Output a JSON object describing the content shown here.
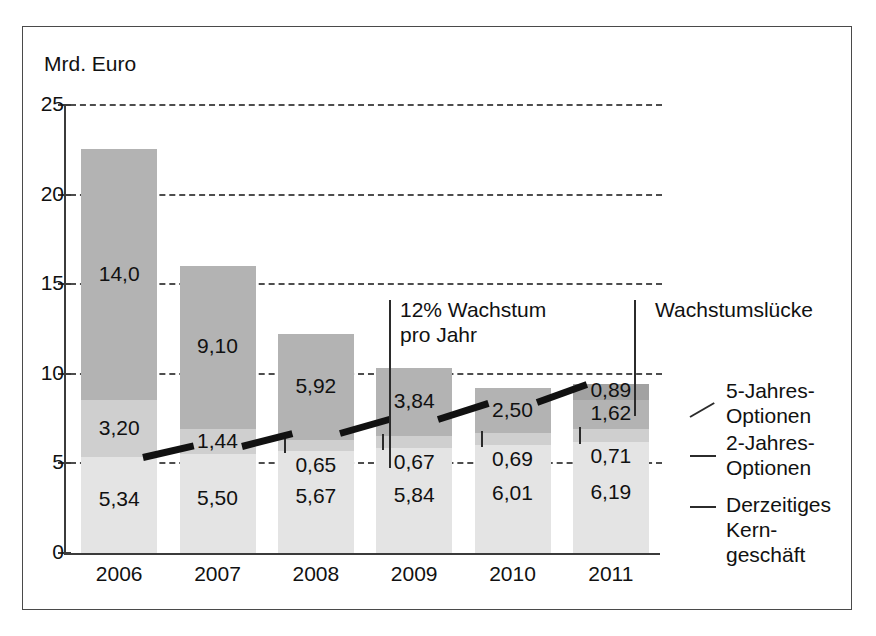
{
  "figure": {
    "y_axis_title": "Mrd. Euro",
    "scan_artifact_text": "· · · · · · · · ·"
  },
  "annotations": {
    "growth_rate": "12% Wachstum\npro Jahr",
    "growth_rate_line1": "12% Wachstum",
    "growth_rate_line2": "pro Jahr",
    "growth_gap": "Wachstumslücke"
  },
  "legend": {
    "items": [
      {
        "label_line1": "5-Jahres-",
        "label_line2": "Optionen",
        "color": "#b3b3b3",
        "key": "options5"
      },
      {
        "label_line1": "2-Jahres-",
        "label_line2": "Optionen",
        "color": "#cfcfcf",
        "key": "options2"
      },
      {
        "label_line1": "Derzeitiges",
        "label_line2": "Kern-",
        "label_line3": "geschäft",
        "color": "#e4e4e4",
        "key": "core"
      }
    ]
  },
  "chart_data": {
    "type": "bar",
    "title": "",
    "subtitle": "",
    "xlabel": "",
    "ylabel": "Mrd. Euro",
    "ylim": [
      0,
      25
    ],
    "yticks": [
      0,
      5,
      10,
      15,
      20,
      25
    ],
    "ytick_labels": [
      "0",
      "5",
      "10",
      "15",
      "20",
      "25"
    ],
    "grid": true,
    "grid_style": "dashed-horizontal",
    "legend_position": "right",
    "stacked": true,
    "categories": [
      "2006",
      "2007",
      "2008",
      "2009",
      "2010",
      "2011"
    ],
    "series": [
      {
        "name": "Derzeitiges Kerngeschäft",
        "color": "#e4e4e4",
        "values": [
          5.34,
          5.5,
          5.67,
          5.84,
          6.01,
          6.19
        ],
        "labels": [
          "5,34",
          "5,50",
          "5,67",
          "5,84",
          "6,01",
          "6,19"
        ]
      },
      {
        "name": "2-Jahres-Optionen",
        "color": "#cfcfcf",
        "values": [
          3.2,
          1.44,
          0.65,
          0.67,
          0.69,
          0.71
        ],
        "labels": [
          "3,20",
          "1,44",
          "0,65",
          "0,67",
          "0,69",
          "0,71"
        ]
      },
      {
        "name": "5-Jahres-Optionen",
        "color": "#b3b3b3",
        "values": [
          14.0,
          9.1,
          5.92,
          3.84,
          2.5,
          1.62
        ],
        "labels": [
          "14,0",
          "9,10",
          "5,92",
          "3,84",
          "2,50",
          "1,62"
        ]
      },
      {
        "name": "Wachstumslücke",
        "color": "#a2a2a2",
        "values": [
          0,
          0,
          0,
          0,
          0,
          0.89
        ],
        "labels": [
          "",
          "",
          "",
          "",
          "",
          "0,89"
        ]
      }
    ],
    "totals": [
      22.54,
      16.04,
      12.24,
      10.35,
      9.2,
      9.41
    ],
    "trend_line": {
      "name": "12% Wachstum pro Jahr",
      "values": [
        5.34,
        5.98,
        6.7,
        7.5,
        8.4,
        9.41
      ],
      "color": "#111111"
    }
  }
}
